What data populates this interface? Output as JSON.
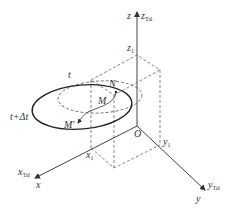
{
  "diagram": {
    "type": "3d-coordinate-sketch",
    "colors": {
      "line": "#444444",
      "curve": "#222222",
      "text": "#333333"
    },
    "axes": {
      "z": {
        "label": "z",
        "alt_label": "z",
        "alt_sub": "Tal"
      },
      "x": {
        "label": "x",
        "alt_label": "x",
        "alt_sub": "Tal"
      },
      "y": {
        "label": "y",
        "alt_label": "y",
        "alt_sub": "Tal"
      },
      "origin": "O"
    },
    "points": {
      "z1": {
        "label": "z",
        "sub": "1"
      },
      "x1": {
        "label": "x",
        "sub": "1"
      },
      "y1": {
        "label": "y",
        "sub": "1"
      },
      "M": "M",
      "M_prime": "M'",
      "N": "N"
    },
    "curves": {
      "dashed_ellipse": {
        "label": "t"
      },
      "solid_ellipse": {
        "label": "t+Δt"
      }
    }
  }
}
